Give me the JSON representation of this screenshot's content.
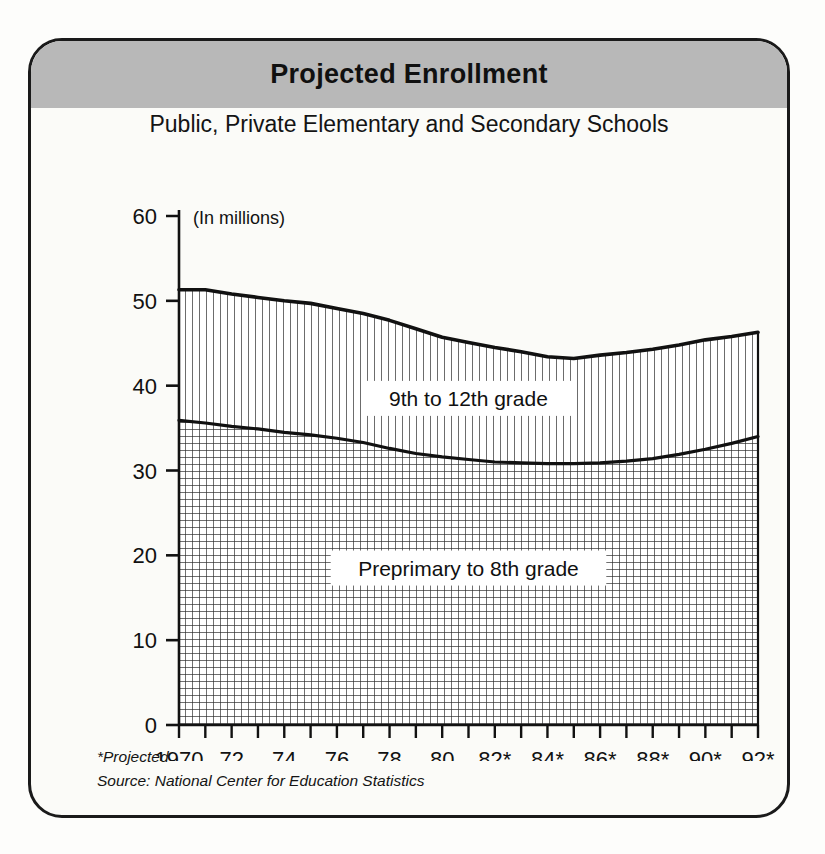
{
  "card": {
    "title": "Projected Enrollment",
    "subtitle": "Public, Private Elementary and Secondary Schools"
  },
  "footnotes": {
    "projected_note": "*Projected",
    "source": "Source: National Center for Education Statistics"
  },
  "colors": {
    "header_band": "#b8b8b8",
    "frame": "#1a1a1a",
    "line": "#111111",
    "page_background": "#fdfdfb",
    "card_background": "#fbfbf8"
  },
  "chart_data": {
    "type": "area",
    "title": "Projected Enrollment",
    "subtitle": "Public, Private Elementary and Secondary Schools",
    "xlabel": "",
    "ylabel": "(In millions)",
    "units_note": "(In millions)",
    "stacked": true,
    "grid": false,
    "legend_position": "inline-annotation",
    "ylim": [
      0,
      60
    ],
    "yticks": [
      0,
      10,
      20,
      30,
      40,
      50,
      60
    ],
    "ytick_labels": [
      "0",
      "10",
      "20",
      "30",
      "40",
      "50",
      "60"
    ],
    "xlim": [
      1970,
      1992
    ],
    "x": [
      1970,
      1971,
      1972,
      1973,
      1974,
      1975,
      1976,
      1977,
      1978,
      1979,
      1980,
      1981,
      1982,
      1983,
      1984,
      1985,
      1986,
      1987,
      1988,
      1989,
      1990,
      1991,
      1992
    ],
    "xticks": [
      1970,
      1971,
      1972,
      1973,
      1974,
      1975,
      1976,
      1977,
      1978,
      1979,
      1980,
      1981,
      1982,
      1983,
      1984,
      1985,
      1986,
      1987,
      1988,
      1989,
      1990,
      1991,
      1992
    ],
    "xtick_labels": [
      "1970",
      "",
      "72",
      "",
      "74",
      "",
      "76",
      "",
      "78",
      "",
      "80",
      "",
      "82*",
      "",
      "84*",
      "",
      "86*",
      "",
      "88*",
      "",
      "90*",
      "",
      "92*"
    ],
    "series": [
      {
        "name": "Preprimary to 8th grade",
        "fill_pattern": "cross-hatch",
        "values": [
          35.9,
          35.6,
          35.2,
          34.9,
          34.5,
          34.2,
          33.8,
          33.3,
          32.6,
          32.0,
          31.6,
          31.3,
          31.0,
          30.9,
          30.8,
          30.8,
          30.9,
          31.1,
          31.4,
          31.9,
          32.5,
          33.2,
          34.0
        ]
      },
      {
        "name": "9th to 12th grade",
        "fill_pattern": "vertical-lines",
        "values": [
          15.4,
          15.7,
          15.6,
          15.5,
          15.5,
          15.5,
          15.3,
          15.2,
          15.1,
          14.7,
          14.1,
          13.8,
          13.5,
          13.1,
          12.6,
          12.4,
          12.7,
          12.8,
          12.9,
          12.9,
          12.9,
          12.6,
          12.3
        ]
      }
    ],
    "totals": [
      51.3,
      51.3,
      50.8,
      50.4,
      50.0,
      49.7,
      49.1,
      48.5,
      47.7,
      46.7,
      45.7,
      45.1,
      44.5,
      44.0,
      43.4,
      43.2,
      43.6,
      43.9,
      44.3,
      44.8,
      45.4,
      45.8,
      46.3
    ],
    "annotations": [
      {
        "text": "9th to 12th grade",
        "x": 1981.0,
        "y": 38.5
      },
      {
        "text": "Preprimary to 8th grade",
        "x": 1981.0,
        "y": 18.5
      }
    ]
  }
}
